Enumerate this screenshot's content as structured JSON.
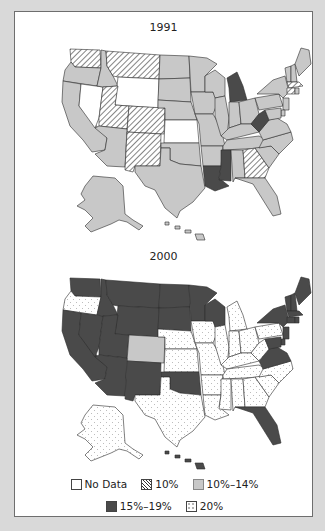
{
  "colors": {
    "background": "#d9d9d9",
    "frame": "#ffffff",
    "no_data": "#ffffff",
    "ten": "hatch",
    "ten_to_fourteen": "#c8c8c8",
    "fifteen_to_nineteen": "#4a4a4a",
    "twenty": "dots"
  },
  "maps": [
    {
      "title": "1991"
    },
    {
      "title": "2000"
    }
  ],
  "legend": {
    "items": [
      {
        "label": "No Data",
        "key": "nodata"
      },
      {
        "label": "10%",
        "key": "p10"
      },
      {
        "label": "10%–14%",
        "key": "p10_14"
      },
      {
        "label": "15%–19%",
        "key": "p15_19"
      },
      {
        "label": "20%",
        "key": "p20"
      }
    ]
  },
  "chart_data": {
    "type": "choropleth",
    "title": "",
    "panels": [
      "1991",
      "2000"
    ],
    "categories": [
      "No Data",
      "10%",
      "10%–14%",
      "15%–19%",
      "20%"
    ],
    "legend_position": "bottom",
    "values": {
      "1991": {
        "No Data": [
          "NV",
          "WY",
          "KS"
        ],
        "10%": [
          "WA",
          "MT",
          "UT",
          "CO",
          "NM",
          "GA",
          "MA",
          "CT"
        ],
        "15%–19%": [
          "MI",
          "WV",
          "MS",
          "LA"
        ],
        "10%–14%": [
          "OR",
          "CA",
          "ID",
          "AZ",
          "ND",
          "SD",
          "NE",
          "OK",
          "TX",
          "MN",
          "IA",
          "MO",
          "AR",
          "WI",
          "IL",
          "IN",
          "OH",
          "KY",
          "TN",
          "AL",
          "FL",
          "SC",
          "NC",
          "VA",
          "PA",
          "NY",
          "VT",
          "NH",
          "ME",
          "RI",
          "NJ",
          "DE",
          "MD",
          "AK",
          "HI"
        ]
      },
      "2000": {
        "15%–19%": [
          "WA",
          "ID",
          "MT",
          "ND",
          "SD",
          "MN",
          "WY",
          "NV",
          "CA",
          "UT",
          "AZ",
          "NM",
          "OK",
          "WI",
          "NY",
          "VT",
          "NH",
          "ME",
          "MA",
          "CT",
          "RI",
          "NJ",
          "DE",
          "MD",
          "VA",
          "FL",
          "HI"
        ],
        "10%–14%": [
          "CO"
        ],
        "20%": [
          "OR",
          "NE",
          "KS",
          "TX",
          "IA",
          "MO",
          "AR",
          "LA",
          "IL",
          "MI",
          "IN",
          "OH",
          "KY",
          "TN",
          "MS",
          "AL",
          "GA",
          "SC",
          "NC",
          "WV",
          "PA",
          "AK"
        ]
      }
    }
  }
}
